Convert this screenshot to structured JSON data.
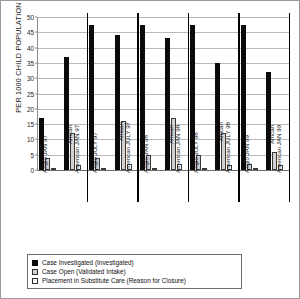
{
  "chart_data": {
    "type": "bar",
    "title": "",
    "xlabel": "",
    "ylabel": "PER 1000 CHILD POPULATION",
    "ylim": [
      0,
      50
    ],
    "yticks": [
      0,
      5,
      10,
      15,
      20,
      25,
      30,
      35,
      40,
      45,
      50
    ],
    "grid": true,
    "legend_position": "bottom",
    "categories": [
      "Anglo JAN 97",
      "African American JAN 97",
      "Anglo JULY 97",
      "African American JULY 97",
      "Anglo JAN 98",
      "African American JAN 98",
      "Anglo JULY 98",
      "African American JULY 98",
      "Anglo JAN 99",
      "African American JAN 99"
    ],
    "category_lines": [
      {
        "l1": "Anglo JAN 97",
        "l2": ""
      },
      {
        "l1": "African",
        "l2": "American JAN 97"
      },
      {
        "l1": "Anglo JULY 97",
        "l2": ""
      },
      {
        "l1": "African",
        "l2": "American JULY 97"
      },
      {
        "l1": "Anglo JAN 98",
        "l2": ""
      },
      {
        "l1": "African",
        "l2": "American JAN 98"
      },
      {
        "l1": "Anglo JULY 98",
        "l2": ""
      },
      {
        "l1": "African",
        "l2": "American JULY 98"
      },
      {
        "l1": "Anglo JAN 99",
        "l2": ""
      },
      {
        "l1": "African",
        "l2": "American JAN 99"
      }
    ],
    "series": [
      {
        "name": "Case Investigated (Investigated)",
        "color": "#0b0b0b",
        "values": [
          17,
          37,
          47.5,
          44,
          47.5,
          43,
          47.5,
          35,
          47.5,
          32
        ]
      },
      {
        "name": "Case Open (Validated Intake)",
        "color": "#d2d2d2",
        "values": [
          4,
          12,
          4,
          16,
          5,
          17,
          5,
          12,
          2,
          6
        ]
      },
      {
        "name": "Placement in Substitute Care (Reason for Closure)",
        "color": "#ffffff",
        "values": [
          0.8,
          1.5,
          0.7,
          2,
          0.7,
          2,
          0.7,
          1.6,
          0.6,
          1.7
        ]
      }
    ]
  },
  "legend": {
    "items": [
      "Case Investigated (Investigated)",
      "Case Open (Validated Intake)",
      "Placement in Substitute Care (Reason for Closure)"
    ]
  }
}
